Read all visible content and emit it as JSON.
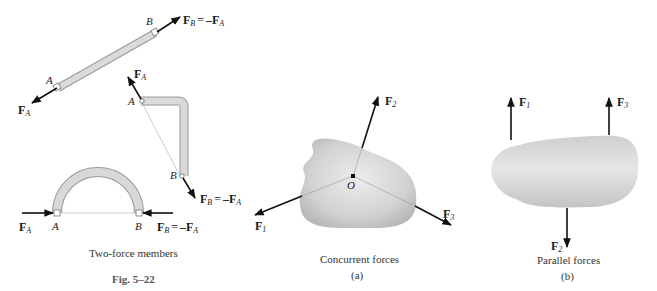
{
  "figure": {
    "title": "Fig. 5–22",
    "captions": {
      "two_force": "Two-force members",
      "concurrent": "Concurrent forces",
      "concurrent_sub": "(a)",
      "parallel": "Parallel forces",
      "parallel_sub": "(b)"
    },
    "colors": {
      "member_fill": "#d6d6d6",
      "member_stroke": "#9a9a9a",
      "body_fill": "#cfcfcf",
      "arrow": "#111111"
    }
  },
  "two_force_members": {
    "straight": {
      "point_a": "A",
      "point_b": "B",
      "force_a": {
        "main": "F",
        "sub": "A"
      },
      "force_b": {
        "main": "F",
        "sub": "B",
        "eq": "=",
        "rhs_main": "–F",
        "rhs_sub": "A"
      }
    },
    "bent": {
      "point_a": "A",
      "point_b": "B",
      "force_a": {
        "main": "F",
        "sub": "A"
      },
      "force_b": {
        "main": "F",
        "sub": "B",
        "eq": "=",
        "rhs_main": "–F",
        "rhs_sub": "A"
      }
    },
    "arch": {
      "point_a": "A",
      "point_b": "B",
      "force_a": {
        "main": "F",
        "sub": "A"
      },
      "force_b": {
        "main": "F",
        "sub": "B",
        "eq": "=",
        "rhs_main": "–F",
        "rhs_sub": "A"
      }
    }
  },
  "concurrent": {
    "origin": "O",
    "forces": [
      {
        "main": "F",
        "sub": "1"
      },
      {
        "main": "F",
        "sub": "2"
      },
      {
        "main": "F",
        "sub": "3"
      }
    ]
  },
  "parallel": {
    "forces": [
      {
        "main": "F",
        "sub": "1"
      },
      {
        "main": "F",
        "sub": "2"
      },
      {
        "main": "F",
        "sub": "3"
      }
    ]
  }
}
